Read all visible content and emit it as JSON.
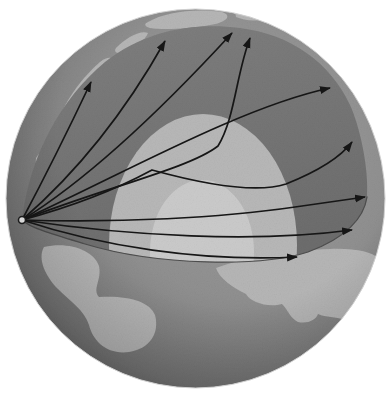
{
  "figure": {
    "name": "earth-cutaway-seismic-ray-paths",
    "colors": {
      "background": "#ffffff",
      "ocean_stop_0": "#9d9d9d",
      "ocean_stop_1": "#909090",
      "ocean_stop_2": "#787878",
      "ocean_stop_3": "#5c5c5c",
      "sphere_edge": "#cfcfcf",
      "continent_light": "#b6b6b6",
      "mantle_face_top": "#7e7e7e",
      "mantle_face_bottom": "#6d6d6d",
      "outer_core": "#b8b8b8",
      "inner_core": "#cbcbcb",
      "rim_line": "#4e4e4e",
      "ray": "#161616",
      "source_fill": "#dcdcdc",
      "source_stroke": "#1c1c1c"
    },
    "sphere": {
      "cx": 195.5,
      "cy": 198.5,
      "r": 189.5
    },
    "cross_section": {
      "face_path": "M22,220 C30,155 60,100 105,62 C145,30 195,22 240,28 C290,34 330,62 350,105 C360,127 369,168 367,197 C364,218 346,238 308,252 C262,267 158,266 85,244 C55,235 30,228 22,220 Z",
      "rim_path": "M367,197 C364,218 346,238 308,252 C262,267 158,266 85,244 C55,235 30,228 22,220",
      "outer_core": {
        "cx": 203,
        "cy": 245,
        "rx": 94,
        "ry": 131
      },
      "inner_core": {
        "cx": 202,
        "cy": 252,
        "rx": 52,
        "ry": 72
      }
    },
    "upper_surface_continents": [
      {
        "id": "patch-greenland",
        "d": "M148,22 C165,12 195,8 222,12 C232,15 228,22 210,25 C188,29 162,30 150,28 C144,26 144,24 148,22 Z"
      },
      {
        "id": "patch-top-right",
        "d": "M235,12 C248,12 258,15 262,19 C255,22 243,20 236,17 Z"
      },
      {
        "id": "patch-north-america",
        "d": "M58,122 C66,98 84,76 100,62 C110,54 118,58 113,68 C104,86 90,108 78,126 C70,137 56,136 58,122 Z"
      },
      {
        "id": "patch-mid-band",
        "d": "M116,48 C126,38 140,30 148,33 C146,40 134,47 124,52 C118,55 113,52 116,48 Z"
      },
      {
        "id": "patch-low-band-1",
        "d": "M36,158 C42,147 52,150 49,162 C46,174 34,172 36,158 Z"
      },
      {
        "id": "patch-low-band-2",
        "d": "M28,190 C33,184 39,187 36,196 C33,203 26,199 28,190 Z"
      }
    ],
    "lower_hemisphere_continents": [
      {
        "id": "patch-south-america",
        "d": "M44,247 C68,241 94,250 99,266 C102,280 92,289 99,297 C126,295 150,301 155,315 C160,334 149,349 129,352 C107,355 93,341 89,325 C85,311 70,301 58,289 C46,277 37,259 44,247 Z"
      },
      {
        "id": "patch-africa",
        "d": "M216,268 C246,257 290,250 330,249 C355,248 372,252 378,258 C373,288 362,308 344,320 C336,316 326,318 318,314 C316,320 308,324 298,322 C290,318 288,310 282,304 C268,308 250,302 246,294 C233,288 219,278 216,268 Z"
      }
    ],
    "earthquake_source": {
      "cx": 22,
      "cy": 220,
      "r": 3.5
    },
    "rays": [
      {
        "id": "ray-1-shallow-left",
        "d": "M22,220 Q55,158 91,82"
      },
      {
        "id": "ray-2-upper-left",
        "d": "M22,220 Q105,148 165,41"
      },
      {
        "id": "ray-3-upper",
        "d": "M22,220 C95,175 175,95 232,33"
      },
      {
        "id": "ray-4-core-grazing",
        "d": "M22,220 C110,186 190,168 218,146 C235,118 236,75 250,38"
      },
      {
        "id": "ray-5-upper-right",
        "d": "M22,220 C115,178 240,107 330,88"
      },
      {
        "id": "ray-6-through-core",
        "d": "M22,220 C85,203 128,183 152,170 C210,186 258,193 286,184 C316,172 340,158 352,142"
      },
      {
        "id": "ray-7-equatorial",
        "d": "M22,220 C120,223 220,218 295,207 C330,202 352,199 365,197"
      },
      {
        "id": "ray-8-deep-core",
        "d": "M22,220 C130,236 255,243 352,230"
      },
      {
        "id": "ray-9-along-rim",
        "d": "M22,220 C100,246 200,262 297,257"
      }
    ],
    "ray_style": {
      "stroke_width": 1.7
    }
  }
}
